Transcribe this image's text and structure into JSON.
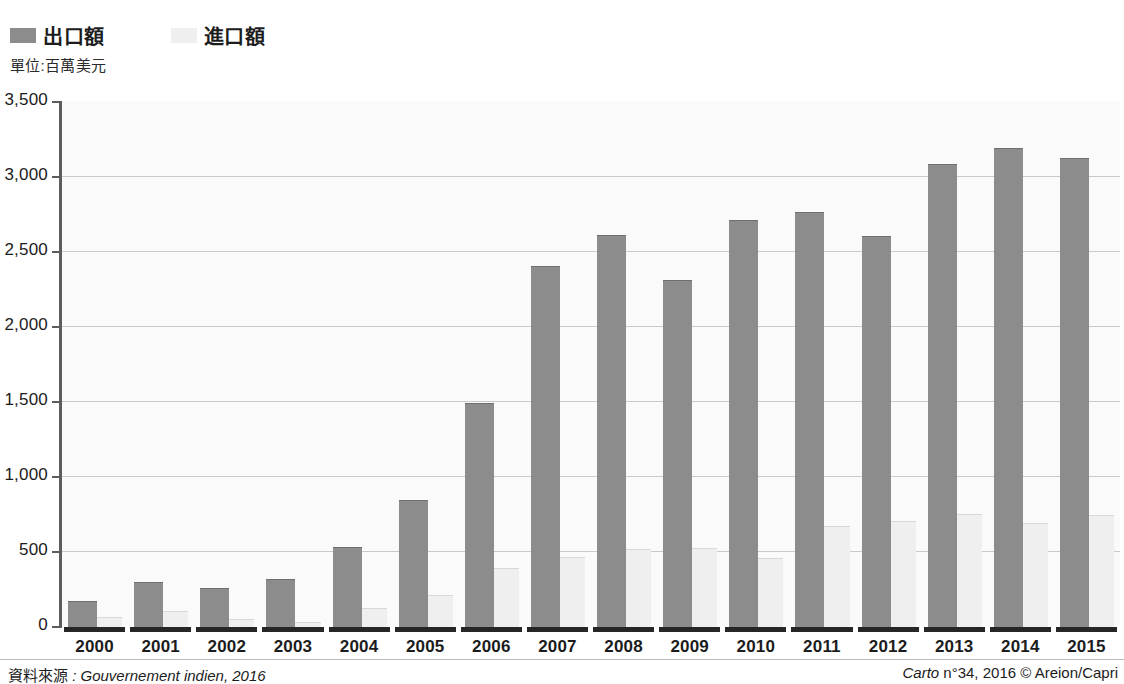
{
  "legend": {
    "items": [
      {
        "label": "出口額",
        "swatch": "exports",
        "color": "#8c8c8c"
      },
      {
        "label": "進口額",
        "swatch": "imports",
        "color": "#efefef"
      }
    ]
  },
  "unit_caption": "單位:百萬美元",
  "footer": {
    "source_label": "資料來源",
    "source_value": ": Gouvernement indien, 2016",
    "credit_publication": "Carto",
    "credit_rest": " n°34, 2016 © Areion/Capri"
  },
  "chart_data": {
    "type": "bar",
    "title": "",
    "subtitle": "",
    "xlabel": "",
    "ylabel": "單位:百萬美元",
    "ylim": [
      0,
      3500
    ],
    "yticks": [
      0,
      500,
      1000,
      1500,
      2000,
      2500,
      3000,
      3500
    ],
    "ytick_labels": [
      "0",
      "500",
      "1,000",
      "1,500",
      "2,000",
      "2,500",
      "3,000",
      "3,500"
    ],
    "grid": true,
    "legend_position": "top-left",
    "categories": [
      "2000",
      "2001",
      "2002",
      "2003",
      "2004",
      "2005",
      "2006",
      "2007",
      "2008",
      "2009",
      "2010",
      "2011",
      "2012",
      "2013",
      "2014",
      "2015"
    ],
    "series": [
      {
        "name": "出口額",
        "color": "#8c8c8c",
        "values": [
          170,
          295,
          255,
          315,
          530,
          840,
          1490,
          2400,
          2610,
          2310,
          2710,
          2760,
          2600,
          3080,
          3190,
          3120
        ]
      },
      {
        "name": "進口額",
        "color": "#efefef",
        "values": [
          60,
          100,
          45,
          30,
          120,
          205,
          390,
          460,
          515,
          520,
          455,
          665,
          700,
          750,
          690,
          740
        ]
      }
    ]
  }
}
